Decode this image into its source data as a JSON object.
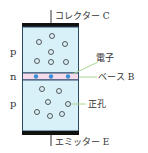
{
  "diagram": {
    "type": "pnp-transistor",
    "labels": {
      "collector": "コレクター C",
      "emitter": "エミッター E",
      "base": "ベース B",
      "electron": "電子",
      "hole": "正孔"
    },
    "layers": [
      "p",
      "n",
      "p"
    ],
    "colors": {
      "p_fill": "#d8f0f8",
      "n_fill": "#f6dceb",
      "electrode": "#111111",
      "leader_line": "#a8d890",
      "electron_dot": "#3a8fd8"
    }
  }
}
